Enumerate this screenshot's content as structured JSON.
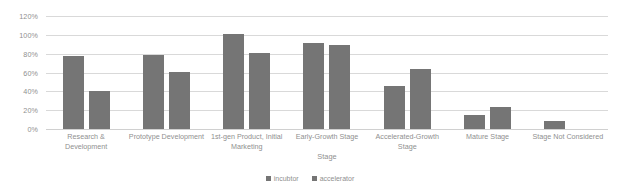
{
  "chart_data": {
    "type": "bar",
    "title": "",
    "xlabel": "Stage",
    "ylabel": "",
    "ylim": [
      0,
      120
    ],
    "ytick_labels": [
      "120%",
      "100%",
      "80%",
      "60%",
      "40%",
      "20%",
      "0%"
    ],
    "ytick_values": [
      120,
      100,
      80,
      60,
      40,
      20,
      0
    ],
    "grid": true,
    "legend_position": "bottom",
    "categories": [
      "Research & Development",
      "Prototype Development",
      "1st-gen Product, Initial Marketing",
      "Early-Growth Stage",
      "Accelerated-Growth Stage",
      "Mature Stage",
      "Stage Not Considered"
    ],
    "series": [
      {
        "name": "incubtor",
        "color": "#757575",
        "values": [
          78,
          79,
          101,
          91,
          46,
          15,
          8
        ]
      },
      {
        "name": "accelerator",
        "color": "#757575",
        "values": [
          40,
          61,
          81,
          89,
          64,
          23,
          0
        ]
      }
    ]
  },
  "colors": {
    "gridline": "#d9d9d9",
    "text": "#8f8f8f",
    "bar": "#757575",
    "background": "#ffffff"
  }
}
